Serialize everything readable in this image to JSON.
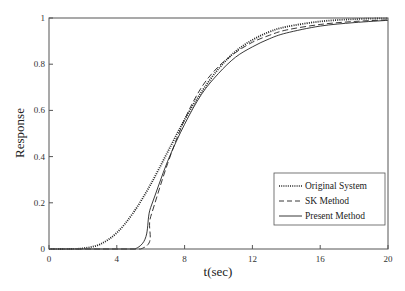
{
  "chart_data": {
    "type": "line",
    "title": "",
    "xlabel": "t(sec)",
    "ylabel": "Response",
    "xlim": [
      0,
      20
    ],
    "ylim": [
      0,
      1
    ],
    "xticks": [
      0,
      4,
      8,
      12,
      16,
      20
    ],
    "yticks": [
      0,
      0.2,
      0.4,
      0.6,
      0.8,
      1
    ],
    "xtick_labels": [
      "0",
      "4",
      "8",
      "12",
      "16",
      "20"
    ],
    "ytick_labels": [
      "0",
      "0.2",
      "0.4",
      "0.6",
      "0.8",
      "1"
    ],
    "grid": false,
    "legend_position": "lower right",
    "series": [
      {
        "name": "Original System",
        "style": "dotted",
        "x": [
          0,
          1,
          2,
          3,
          4,
          5,
          6,
          7,
          8,
          9,
          10,
          11,
          12,
          13,
          14,
          16,
          18,
          20
        ],
        "y": [
          0,
          0.0,
          0.003,
          0.02,
          0.07,
          0.16,
          0.28,
          0.42,
          0.56,
          0.68,
          0.78,
          0.855,
          0.905,
          0.94,
          0.962,
          0.985,
          0.995,
          0.999
        ]
      },
      {
        "name": "SK Method",
        "style": "dashed",
        "x": [
          0,
          5.4,
          6,
          7,
          8,
          9,
          10,
          11,
          12,
          13,
          14,
          16,
          18,
          20
        ],
        "y": [
          0,
          0,
          0.14,
          0.37,
          0.56,
          0.7,
          0.79,
          0.85,
          0.895,
          0.925,
          0.948,
          0.972,
          0.985,
          0.992
        ]
      },
      {
        "name": "Present Method",
        "style": "solid",
        "x": [
          0,
          5.07,
          6,
          7,
          8,
          9,
          10,
          11,
          12,
          13,
          14,
          16,
          18,
          20
        ],
        "y": [
          0,
          0,
          0.18,
          0.38,
          0.54,
          0.67,
          0.76,
          0.83,
          0.875,
          0.91,
          0.935,
          0.965,
          0.98,
          0.99
        ]
      }
    ]
  },
  "legend": {
    "items": [
      {
        "label": "Original System",
        "style": "dotted"
      },
      {
        "label": "SK Method",
        "style": "dashed"
      },
      {
        "label": "Present Method",
        "style": "solid"
      }
    ]
  },
  "axes": {
    "xlabel": "t(sec)",
    "ylabel": "Response"
  }
}
